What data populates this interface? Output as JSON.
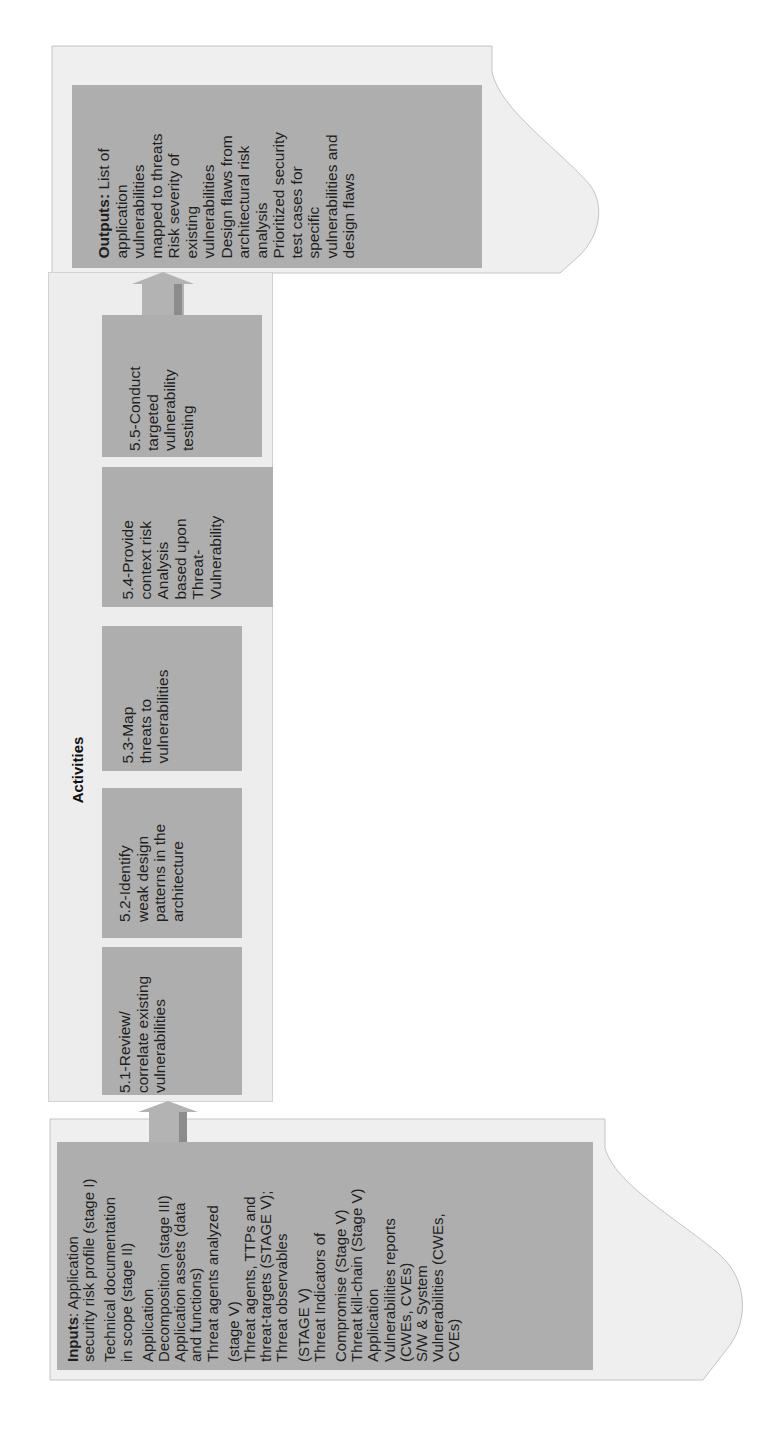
{
  "outputs": {
    "label": "Outputs:",
    "lines": [
      " List of",
      "application",
      "vulnerabilities",
      "mapped to threats",
      "Risk severity of",
      "existing",
      "vulnerabilities",
      "Design flaws from",
      "architectural risk",
      "analysis",
      "Prioritized security",
      "test cases for",
      "specific",
      "vulnerabilities and",
      "design flaws"
    ]
  },
  "activities": {
    "title": "Activities",
    "items": [
      {
        "id": "5.1",
        "lines": [
          "5.1-Review/",
          "correlate existing",
          "vulnerabilities"
        ]
      },
      {
        "id": "5.2",
        "lines": [
          "5.2-Identify",
          "weak design",
          "patterns in the",
          "architecture"
        ]
      },
      {
        "id": "5.3",
        "lines": [
          "5.3-Map",
          "threats to",
          "vulnerabilities"
        ]
      },
      {
        "id": "5.4",
        "lines": [
          "5.4-Provide",
          "context risk",
          "Analysis",
          "based upon",
          "Threat-",
          "Vulnerability"
        ]
      },
      {
        "id": "5.5",
        "lines": [
          "5.5-Conduct",
          "targeted",
          "vulnerability",
          "testing"
        ]
      }
    ]
  },
  "inputs": {
    "label": "Inputs",
    "first_line_rest": ": Application",
    "lines": [
      "security risk profile (stage I)",
      "Technical documentation",
      "in scope (stage II)",
      "Application",
      "Decomposition (stage III)",
      "Application assets (data",
      "and functions)",
      "Threat agents analyzed",
      "(stage V)",
      "Threat agents, TTPs and",
      "threat-targets (STAGE V);",
      "Threat observables",
      "(STAGE V)",
      "Threat Indicators of",
      "Compromise (Stage V)",
      "Threat kill-chain (Stage V)",
      "Application",
      "Vulnerabilities reports",
      "(CWEs, CVEs)",
      "S/W & System",
      "Vulnerabilities (CWEs,",
      "CVEs)"
    ]
  },
  "colors": {
    "doc_fill": "#efefef",
    "doc_stroke": "#bdbdbd",
    "box_fill": "#aeaeae",
    "arrow_fill": "#a9a9a9",
    "arrow_shade": "#8c8c8c"
  }
}
